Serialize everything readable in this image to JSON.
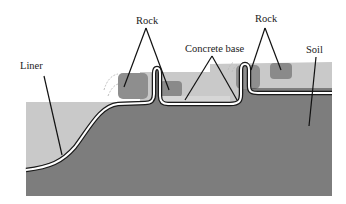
{
  "diagram": {
    "type": "cross-section",
    "labels": {
      "rock_left": "Rock",
      "rock_right": "Rock",
      "concrete_base": "Concrete base",
      "soil": "Soil",
      "liner": "Liner"
    },
    "colors": {
      "background": "#ffffff",
      "fill_region": "#c9c9c9",
      "soil": "#7d7d7d",
      "rock": "#8e8e8e",
      "liner_outline": "#1a1a1a",
      "liner_core": "#ffffff",
      "leader_line": "#111111"
    }
  }
}
